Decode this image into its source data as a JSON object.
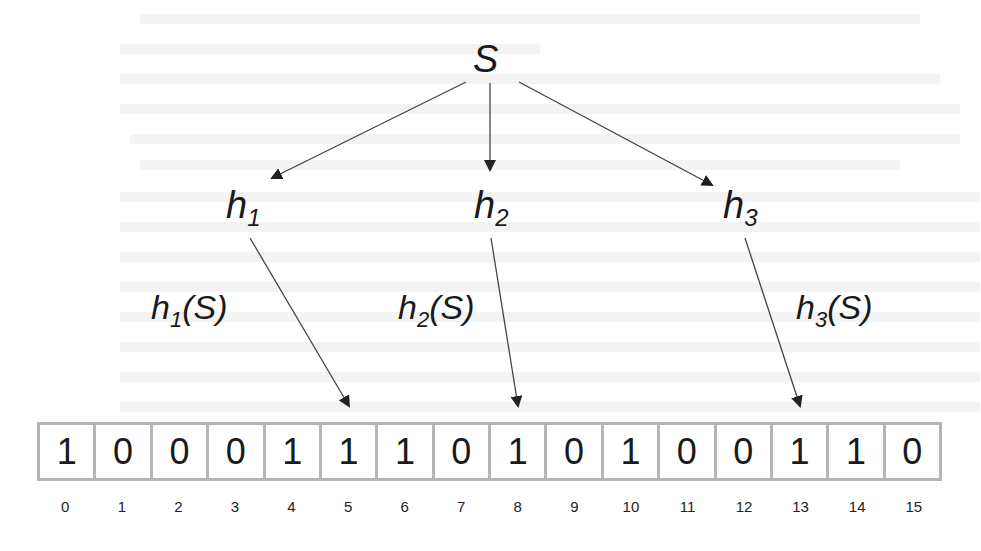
{
  "diagram": {
    "type": "bloom-filter-hashing",
    "source_node": {
      "label": "S"
    },
    "hash_functions": [
      {
        "name": "h",
        "sub": "1",
        "mapping_label": "(S)",
        "target_index": 5
      },
      {
        "name": "h",
        "sub": "2",
        "mapping_label": "(S)",
        "target_index": 8
      },
      {
        "name": "h",
        "sub": "3",
        "mapping_label": "(S)",
        "target_index": 13
      }
    ],
    "bit_array": {
      "bits": [
        "1",
        "0",
        "0",
        "0",
        "1",
        "1",
        "1",
        "0",
        "1",
        "0",
        "1",
        "0",
        "0",
        "1",
        "1",
        "0"
      ],
      "indices": [
        "0",
        "1",
        "2",
        "3",
        "4",
        "5",
        "6",
        "7",
        "8",
        "9",
        "10",
        "11",
        "12",
        "13",
        "14",
        "15"
      ]
    },
    "colors": {
      "cell_border": "#b5b5b5",
      "text": "#1a1a1a",
      "arrow": "#333333"
    }
  }
}
